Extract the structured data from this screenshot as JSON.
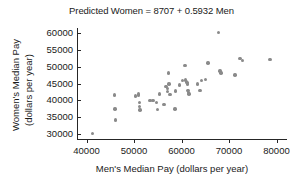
{
  "chart_data": {
    "type": "scatter",
    "title": "Predicted Women = 8707 + 0.5932 Men",
    "xlabel": "Men's Median Pay (dollars per year)",
    "ylabel_line1": "Women's Median Pay",
    "ylabel_line2": "(dollars per year)",
    "xlim": [
      38000,
      82000
    ],
    "ylim": [
      28500,
      61500
    ],
    "xticks": [
      40000,
      50000,
      60000,
      70000,
      80000
    ],
    "xtick_labels": [
      "40000",
      "50000",
      "60000",
      "70000",
      "80000"
    ],
    "yticks": [
      30000,
      35000,
      40000,
      45000,
      50000,
      55000,
      60000
    ],
    "ytick_labels": [
      "30000",
      "35000",
      "40000",
      "45000",
      "50000",
      "55000",
      "60000"
    ],
    "grid": false,
    "legend": null,
    "marker_color": "#8a8a8a",
    "regression_slope": 0.5932,
    "regression_intercept": 8707,
    "points": [
      [
        41200,
        30100
      ],
      [
        45900,
        41600
      ],
      [
        46000,
        37400
      ],
      [
        46100,
        34100
      ],
      [
        50300,
        41300
      ],
      [
        50900,
        41900
      ],
      [
        51000,
        41500
      ],
      [
        51100,
        39300
      ],
      [
        51200,
        38200
      ],
      [
        51300,
        37100
      ],
      [
        53400,
        39900
      ],
      [
        54000,
        40000
      ],
      [
        54700,
        39400
      ],
      [
        54900,
        37200
      ],
      [
        55400,
        41900
      ],
      [
        56300,
        38800
      ],
      [
        56700,
        44100
      ],
      [
        57000,
        43500
      ],
      [
        57100,
        42600
      ],
      [
        57200,
        48100
      ],
      [
        57400,
        44800
      ],
      [
        57600,
        41800
      ],
      [
        58600,
        37400
      ],
      [
        58700,
        42800
      ],
      [
        59600,
        44600
      ],
      [
        60200,
        45900
      ],
      [
        60700,
        50300
      ],
      [
        60900,
        46000
      ],
      [
        61000,
        45500
      ],
      [
        61200,
        45300
      ],
      [
        61300,
        44900
      ],
      [
        61400,
        42900
      ],
      [
        61500,
        42300
      ],
      [
        61600,
        41900
      ],
      [
        63400,
        44900
      ],
      [
        63900,
        43000
      ],
      [
        64200,
        45900
      ],
      [
        65000,
        46200
      ],
      [
        65600,
        51100
      ],
      [
        67800,
        60200
      ],
      [
        68100,
        48700
      ],
      [
        68300,
        48100
      ],
      [
        71300,
        47500
      ],
      [
        72300,
        52500
      ],
      [
        72900,
        51800
      ],
      [
        78600,
        52100
      ]
    ]
  }
}
